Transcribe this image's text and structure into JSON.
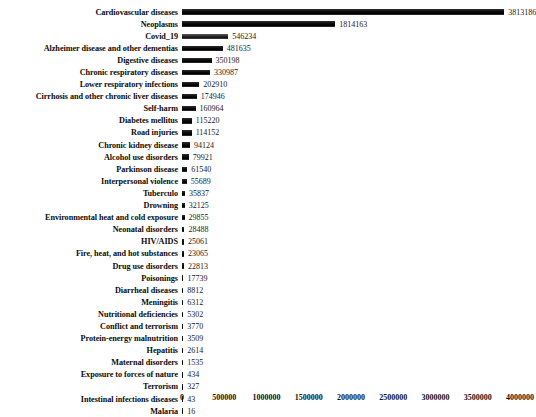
{
  "chart_data": {
    "type": "bar",
    "orientation": "horizontal",
    "title": "",
    "subtitle": "",
    "xlabel": "",
    "ylabel": "",
    "grid": false,
    "legend": null,
    "xlim": [
      0,
      4000000
    ],
    "xticks": [
      "0",
      "500000",
      "1000000",
      "1500000",
      "2000000",
      "2500000",
      "3000000",
      "3500000",
      "4000000"
    ],
    "xtick_values": [
      0,
      500000,
      1000000,
      1500000,
      2000000,
      2500000,
      3000000,
      3500000,
      4000000
    ],
    "categories": [
      "Cardiovascular diseases",
      "Neoplasms",
      "Covid_19",
      "Alzheimer disease and other dementias",
      "Digestive diseases",
      "Chronic respiratory diseases",
      "Lower respiratory infections",
      "Cirrhosis and other chronic liver diseases",
      "Self-harm",
      "Diabetes mellitus",
      "Road injuries",
      "Chronic kidney disease",
      "Alcohol use disorders",
      "Parkinson disease",
      "Interpersonal violence",
      "Tuberculo",
      "Drowning",
      "Environmental heat and cold exposure",
      "Neonatal disorders",
      "HIV/AIDS",
      "Fire, heat, and hot substances",
      "Drug use disorders",
      "Poisonings",
      "Diarrheal diseases",
      "Meningitis",
      "Nutritional deficiencies",
      "Conflict and terrorism",
      "Protein-energy malnutrition",
      "Hepatitis",
      "Maternal disorders",
      "Exposure to forces of nature",
      "Terrorism",
      "Intestinal infections diseases",
      "Malaria"
    ],
    "values": [
      3813186,
      1814163,
      546234,
      481635,
      350198,
      330987,
      202910,
      174946,
      160964,
      115220,
      114152,
      94124,
      79921,
      61540,
      55689,
      35837,
      32125,
      29855,
      28488,
      25061,
      23065,
      22813,
      17739,
      8812,
      6312,
      5302,
      3770,
      3509,
      2614,
      1535,
      434,
      327,
      43,
      16
    ],
    "value_labels": [
      "3813186",
      "1814163",
      "546234",
      "481635",
      "350198",
      "330987",
      "202910",
      "174946",
      "160964",
      "115220",
      "114152",
      "94124",
      "79921",
      "61540",
      "55689",
      "35837",
      "32125",
      "29855",
      "28488",
      "25061",
      "23065",
      "22813",
      "17739",
      "8812",
      "6312",
      "5302",
      "3770",
      "3509",
      "2614",
      "1535",
      "434",
      "327",
      "43",
      "16"
    ],
    "highlighted_index": 2,
    "bar_color": "#141414",
    "bar_color_highlight": "#4a4a4a",
    "text_color": "#111111"
  }
}
